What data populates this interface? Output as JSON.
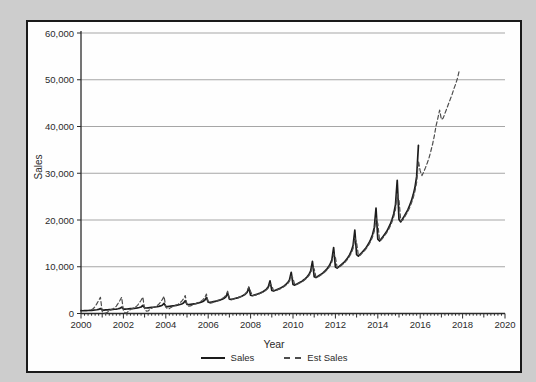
{
  "window": {
    "background_color": "#cdcdcd",
    "panel_background": "#fefefe",
    "panel_border_color": "#1a1a1a"
  },
  "chart_data": {
    "type": "line",
    "title": "",
    "xlabel": "Year",
    "ylabel": "Sales",
    "xlim": [
      2000,
      2020
    ],
    "ylim": [
      0,
      60000
    ],
    "x_ticks": [
      2000,
      2002,
      2004,
      2006,
      2008,
      2010,
      2012,
      2014,
      2016,
      2018,
      2020
    ],
    "y_ticks": [
      0,
      10000,
      20000,
      30000,
      40000,
      50000,
      60000
    ],
    "y_tick_labels": [
      "0",
      "10,000",
      "20,000",
      "30,000",
      "40,000",
      "50,000",
      "60,000"
    ],
    "grid": "horizontal-only",
    "grid_color": "#a6a6a6",
    "axis_color": "#2b2b2b",
    "legend_position": "bottom-center",
    "x_minor_tick_interval_years": 0.1666667,
    "series": [
      {
        "name": "Sales",
        "style": "solid",
        "color": "#1c1c1c",
        "start": 2000.0,
        "step_years": 0.0833333,
        "values": [
          599,
          583,
          602,
          620,
          640,
          660,
          688,
          717,
          754,
          801,
          873,
          1071,
          757,
          737,
          761,
          784,
          809,
          834,
          869,
          906,
          953,
          1012,
          1104,
          1354,
          956,
          932,
          962,
          991,
          1022,
          1054,
          1099,
          1145,
          1205,
          1279,
          1395,
          1712,
          1209,
          1178,
          1215,
          1253,
          1292,
          1332,
          1389,
          1448,
          1523,
          1617,
          1763,
          2164,
          1528,
          1489,
          1536,
          1584,
          1633,
          1684,
          1755,
          1830,
          1925,
          2044,
          2229,
          2735,
          1931,
          1882,
          1942,
          2002,
          2064,
          2129,
          2219,
          2313,
          2433,
          2583,
          2817,
          3457,
          2441,
          2379,
          2454,
          2530,
          2609,
          2690,
          2804,
          2924,
          3076,
          3265,
          3561,
          4369,
          3085,
          3007,
          3103,
          3199,
          3298,
          3401,
          3545,
          3696,
          3888,
          4128,
          4501,
          5523,
          3900,
          3800,
          3922,
          4043,
          4169,
          4299,
          4481,
          4671,
          4914,
          5217,
          5690,
          6981,
          4929,
          4804,
          4957,
          5110,
          5269,
          5433,
          5663,
          5904,
          6211,
          6595,
          7192,
          8824,
          6231,
          6072,
          6266,
          6459,
          6660,
          6868,
          7159,
          7463,
          7851,
          8336,
          9090,
          11153,
          7876,
          7675,
          7920,
          8165,
          8418,
          8681,
          9048,
          9434,
          9924,
          10536,
          11490,
          14098,
          9955,
          9701,
          10010,
          10320,
          10641,
          10973,
          11437,
          11924,
          12543,
          13318,
          14523,
          17819,
          12583,
          12262,
          12653,
          13044,
          13450,
          13869,
          14457,
          15072,
          15855,
          16833,
          18357,
          22524,
          15905,
          15499,
          15993,
          16488,
          17001,
          17531,
          18273,
          19051,
          20040,
          21277,
          23204,
          28470,
          20104,
          19590,
          20216,
          20841,
          21489,
          22159,
          23097,
          24080,
          25331,
          26895,
          29329,
          35986
        ]
      },
      {
        "name": "Est Sales",
        "style": "dashed",
        "color": "#4d4d4d",
        "start": 2000.5,
        "step_years": 0.0833333,
        "values": [
          808,
          1077,
          1474,
          2121,
          2793,
          3471,
          442,
          80,
          80,
          259,
          599,
          834,
          974,
          1221,
          1583,
          2167,
          2784,
          3454,
          686,
          122,
          152,
          541,
          842,
          1054,
          1189,
          1415,
          1745,
          2269,
          2835,
          3512,
          984,
          503,
          540,
          878,
          1142,
          1332,
          1464,
          1673,
          1973,
          2442,
          2963,
          3664,
          1363,
          994,
          1041,
          1309,
          1523,
          1684,
          1810,
          1995,
          2255,
          2649,
          3109,
          3835,
          1826,
          1567,
          1627,
          1827,
          1994,
          2129,
          2254,
          2418,
          2643,
          2968,
          3377,
          4157,
          2381,
          2199,
          2274,
          2430,
          2569,
          2690,
          2824,
          2984,
          3196,
          3485,
          3881,
          4769,
          3055,
          2917,
          3013,
          3149,
          3278,
          3401,
          3555,
          3726,
          3948,
          4238,
          4661,
          5723,
          4712,
          3850,
          3861,
          3983,
          4106,
          4234,
          4390,
          4576,
          4793,
          5066,
          5454,
          6336,
          5955,
          4867,
          4881,
          5034,
          5190,
          5351,
          5548,
          5784,
          6058,
          6403,
          6894,
          8008,
          7528,
          6152,
          6169,
          6363,
          6560,
          6764,
          7014,
          7311,
          7657,
          8094,
          8713,
          10122,
          9515,
          7776,
          7798,
          8043,
          8292,
          8550,
          8865,
          9241,
          9679,
          10230,
          11013,
          12794,
          12027,
          9828,
          9856,
          10165,
          10481,
          10807,
          11205,
          11681,
          12234,
          12931,
          13921,
          16171,
          15201,
          12423,
          12458,
          12849,
          13247,
          13660,
          14163,
          14765,
          15464,
          16344,
          17595,
          20441,
          19215,
          15702,
          15746,
          16241,
          16745,
          17266,
          17902,
          18662,
          19546,
          20659,
          22241,
          25837,
          24287,
          19847,
          19903,
          20529,
          21165,
          21824,
          22628,
          23589,
          24706,
          26113,
          28112,
          32658,
          30500,
          29500,
          30300,
          31200,
          32200,
          33300,
          34700,
          36200,
          38000,
          40200,
          41800,
          43500,
          41500,
          41800,
          42800,
          43800,
          44800,
          45800,
          46800,
          48000,
          49000,
          50200,
          51800
        ]
      }
    ]
  }
}
